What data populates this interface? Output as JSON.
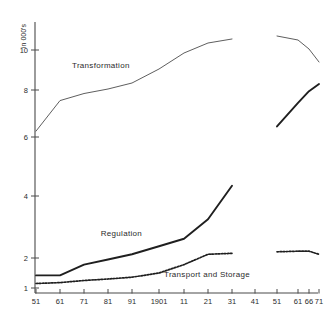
{
  "chart_data": {
    "type": "line",
    "title": "",
    "xlabel": "",
    "ylabel": "in 000's",
    "grid": false,
    "legend_position": "inline-annotations",
    "xlim": [
      1851,
      1971
    ],
    "ylim": [
      1,
      11
    ],
    "y_ticks": [
      1,
      2,
      4,
      6,
      8,
      10
    ],
    "y_tick_labels": [
      "1",
      "2",
      "4",
      "6",
      "8",
      "10"
    ],
    "x_ticks": [
      1851,
      1861,
      1871,
      1881,
      1891,
      1901,
      1911,
      1921,
      1931,
      1941,
      1951,
      1961,
      1966,
      1971
    ],
    "x_tick_labels": [
      "51",
      "61",
      "71",
      "81",
      "91",
      "1901",
      "11",
      "21",
      "31",
      "41",
      "51",
      "61",
      "66",
      "71"
    ],
    "axis_break": {
      "after": 1931,
      "resumes": 1951
    },
    "series": [
      {
        "name": "Transformation",
        "style": "thin-solid",
        "color": "#4c4c4c",
        "label_x": 1866,
        "label_y": 9.1,
        "segments": [
          {
            "x": [
              1851,
              1861,
              1871,
              1881,
              1891,
              1901,
              1911,
              1921,
              1931
            ],
            "y": [
              6.25,
              7.55,
              7.85,
              8.05,
              8.35,
              9.05,
              9.85,
              10.35,
              10.55
            ]
          },
          {
            "x": [
              1951,
              1961,
              1966,
              1971
            ],
            "y": [
              10.7,
              10.5,
              10.05,
              9.4
            ]
          }
        ]
      },
      {
        "name": "Regulation",
        "style": "thick-solid",
        "color": "#1f1f1f",
        "label_x": 1878,
        "label_y": 2.72,
        "segments": [
          {
            "x": [
              1851,
              1861,
              1871,
              1881,
              1891,
              1901,
              1911,
              1921,
              1931
            ],
            "y": [
              1.42,
              1.42,
              1.78,
              1.95,
              2.12,
              2.38,
              2.62,
              3.25,
              4.35
            ]
          },
          {
            "x": [
              1951,
              1961,
              1966,
              1971
            ],
            "y": [
              6.45,
              7.45,
              7.95,
              8.3
            ]
          }
        ]
      },
      {
        "name": "Transport and Storage",
        "style": "dotted",
        "color": "#1f1f1f",
        "label_x": 1903,
        "label_y": 1.38,
        "segments": [
          {
            "x": [
              1851,
              1861,
              1871,
              1881,
              1891,
              1901,
              1911,
              1921,
              1931
            ],
            "y": [
              1.15,
              1.18,
              1.25,
              1.3,
              1.36,
              1.5,
              1.78,
              2.12,
              2.15
            ]
          },
          {
            "x": [
              1951,
              1961,
              1966,
              1971
            ],
            "y": [
              2.2,
              2.22,
              2.22,
              2.12
            ]
          }
        ]
      }
    ]
  },
  "labels": {
    "y_axis_title": "in 000's",
    "transformation": "Transformation",
    "regulation": "Regulation",
    "transport_and_storage": "Transport  and  Storage"
  }
}
